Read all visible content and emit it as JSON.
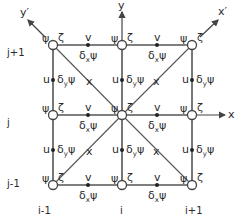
{
  "diagram": {
    "type": "staggered finite-difference grid stencil",
    "axes": {
      "x": "x",
      "y": "y",
      "x_rot": "x′",
      "y_rot": "y′"
    },
    "row_labels": [
      "j+1",
      "j",
      "j-1"
    ],
    "col_labels": [
      "i-1",
      "i",
      "i+1"
    ],
    "node_labels": {
      "psi": "ψ",
      "zeta": "ζ"
    },
    "edge_labels": {
      "v": "v",
      "u": "u",
      "dx_psi_delta": "δ",
      "dx_psi_sub": "x",
      "dy_psi_sub": "y",
      "psi": "ψ",
      "diag": "x"
    },
    "colors": {
      "line": "#555555",
      "text": "#2a2a2a",
      "node_fill": "#ffffff"
    }
  }
}
